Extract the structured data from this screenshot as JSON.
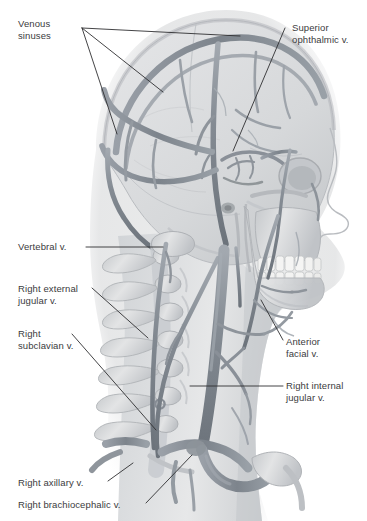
{
  "figure": {
    "background_color": "#ffffff",
    "width": 367,
    "height": 521
  },
  "palette": {
    "vein": "#8a9098",
    "vein_dark": "#6f767f",
    "vein_light": "#a8aeb5",
    "bone": "#d9dbdd",
    "bone_shadow": "#b6b9bd",
    "bone_light": "#eceded",
    "soft_tissue": "#cfd2d5",
    "brain": "#dcdee0",
    "label_text": "#3b3b3d",
    "leader_line": "#2f2f31"
  },
  "labels": [
    {
      "id": "venous-sinuses",
      "text": "Venous\nsinuses",
      "x": 18,
      "y": 18,
      "align": "left"
    },
    {
      "id": "superior-ophthalmic",
      "text": "Superior\nophthalmic v.",
      "x": 292,
      "y": 22,
      "align": "left"
    },
    {
      "id": "vertebral",
      "text": "Vertebral v.",
      "x": 18,
      "y": 241,
      "align": "left"
    },
    {
      "id": "right-external-jugular",
      "text": "Right external\njugular v.",
      "x": 18,
      "y": 283,
      "align": "left"
    },
    {
      "id": "right-subclavian",
      "text": "Right\nsubclavian v.",
      "x": 18,
      "y": 328,
      "align": "left"
    },
    {
      "id": "anterior-facial",
      "text": "Anterior\nfacial v.",
      "x": 286,
      "y": 336,
      "align": "left"
    },
    {
      "id": "right-internal-jugular",
      "text": "Right internal\njugular v.",
      "x": 286,
      "y": 380,
      "align": "left"
    },
    {
      "id": "right-axillary",
      "text": "Right axillary v.",
      "x": 18,
      "y": 477,
      "align": "left"
    },
    {
      "id": "right-brachiocephalic",
      "text": "Right brachiocephalic v.",
      "x": 18,
      "y": 499,
      "align": "left"
    }
  ],
  "leaders": [
    {
      "id": "venous-sinuses-a",
      "points": "82,28 240,36"
    },
    {
      "id": "venous-sinuses-b",
      "points": "82,28 163,92"
    },
    {
      "id": "venous-sinuses-c",
      "points": "82,28 117,134"
    },
    {
      "id": "superior-ophthalmic",
      "points": "285,28 233,151"
    },
    {
      "id": "vertebral",
      "points": "86,247 163,247"
    },
    {
      "id": "right-external-jugular",
      "points": "92,288 148,338"
    },
    {
      "id": "right-subclavian",
      "points": "72,334 156,430"
    },
    {
      "id": "anterior-facial",
      "points": "283,340 261,300"
    },
    {
      "id": "right-internal-jugular",
      "points": "283,386 190,386"
    },
    {
      "id": "right-axillary",
      "points": "108,481 133,463"
    },
    {
      "id": "right-brachiocephalic",
      "points": "146,503 192,455"
    }
  ],
  "structures": [
    "cranium",
    "brain",
    "superior sagittal sinus",
    "transverse sinus",
    "sigmoid sinus",
    "cavernous sinus",
    "superior ophthalmic vein",
    "orbit",
    "nasal profile",
    "maxilla",
    "mandible",
    "teeth",
    "cervical vertebrae",
    "vertebral vein",
    "external jugular vein",
    "internal jugular vein",
    "anterior facial vein",
    "subclavian vein",
    "axillary vein",
    "brachiocephalic vein",
    "clavicle",
    "first rib"
  ]
}
